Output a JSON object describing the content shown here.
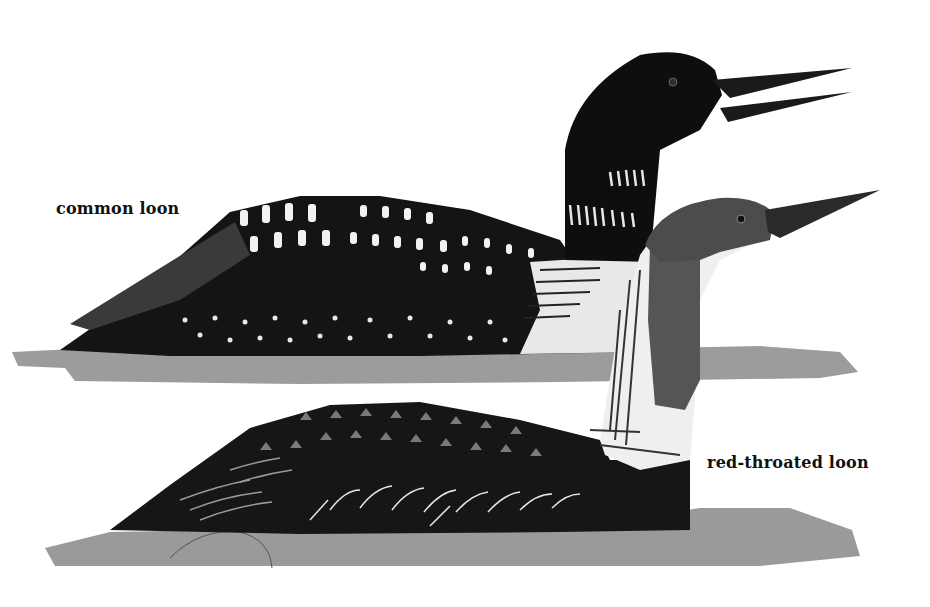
{
  "figure": {
    "labels": {
      "common_loon": "common loon",
      "red_throated_loon": "red-throated loon"
    },
    "colors": {
      "background": "#ffffff",
      "water": "#9c9c9c",
      "common_loon_body": "#111111",
      "red_throated_head": "#4a4a4a",
      "spots": "#f2f2f2"
    }
  }
}
